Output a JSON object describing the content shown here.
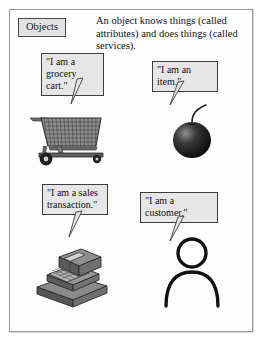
{
  "figure": {
    "label": "Objects",
    "caption": "An object knows things (called attributes) and does things (called services).",
    "colors": {
      "frame_border": "#9a9a9a",
      "bubble_fill": "#e6e6e6",
      "bubble_border": "#3d3d3d",
      "label_fill": "#e2e2e2",
      "ink": "#111111",
      "cart_gray": "#6f6f6f",
      "item_dark": "#1b1b1b",
      "register_gray": "#777777",
      "page_background": "#ffffff"
    },
    "objects": [
      {
        "id": "grocery-cart",
        "icon": "shopping-cart-icon",
        "quote": "\"I am a\ngrocery cart.\""
      },
      {
        "id": "item",
        "icon": "cherry-item-icon",
        "quote": "\"I am an item.\""
      },
      {
        "id": "sales-transaction",
        "icon": "cash-register-icon",
        "quote": "\"I am a sales\ntransaction.\""
      },
      {
        "id": "customer",
        "icon": "person-stick-figure-icon",
        "quote": "\"I am a customer.\""
      }
    ]
  }
}
